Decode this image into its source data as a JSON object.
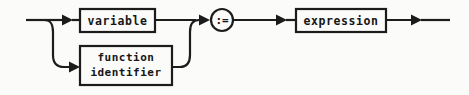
{
  "diagram": {
    "kind": "railroad-syntax-diagram",
    "background_color": "#fbfbfa",
    "line_color": "#1c1c1c",
    "text_color": "#161616",
    "nodes": [
      {
        "id": "variable",
        "type": "terminal-box",
        "label": "variable",
        "branch": "upper"
      },
      {
        "id": "function-identifier",
        "type": "terminal-box",
        "label_line1": "function",
        "label_line2": "identifier",
        "branch": "lower"
      },
      {
        "id": "assign-operator",
        "type": "circle",
        "label": ":="
      },
      {
        "id": "expression",
        "type": "terminal-box",
        "label": "expression"
      }
    ],
    "arrows": [
      {
        "id": "arrow-into-variable",
        "direction": "right"
      },
      {
        "id": "arrow-into-function-identifier",
        "direction": "right"
      },
      {
        "id": "arrow-into-assign-operator",
        "direction": "right"
      },
      {
        "id": "arrow-into-expression",
        "direction": "right"
      },
      {
        "id": "arrow-exit",
        "direction": "right"
      }
    ]
  }
}
